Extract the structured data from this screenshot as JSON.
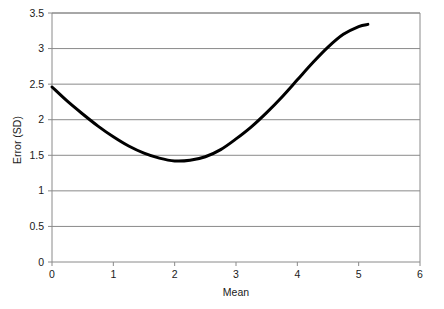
{
  "chart_data": {
    "type": "line",
    "title": "",
    "xlabel": "Mean",
    "ylabel": "Error (SD)",
    "xlim": [
      0,
      6
    ],
    "ylim": [
      0,
      3.5
    ],
    "xticks": [
      "0",
      "1",
      "2",
      "3",
      "4",
      "5",
      "6"
    ],
    "xtick_values": [
      0,
      1,
      2,
      3,
      4,
      5,
      6
    ],
    "yticks": [
      "0",
      "0.5",
      "1",
      "1.5",
      "2",
      "2.5",
      "3",
      "3.5"
    ],
    "ytick_values": [
      0,
      0.5,
      1,
      1.5,
      2,
      2.5,
      3,
      3.5
    ],
    "grid": "horizontal",
    "legend": "none",
    "series": [
      {
        "name": "Error curve",
        "color": "#000000",
        "line_width": 3,
        "x": [
          0.0,
          0.25,
          0.5,
          0.75,
          1.0,
          1.25,
          1.5,
          1.75,
          2.0,
          2.25,
          2.5,
          2.75,
          3.0,
          3.25,
          3.5,
          3.75,
          4.0,
          4.25,
          4.5,
          4.75,
          5.0,
          5.15
        ],
        "values": [
          2.46,
          2.26,
          2.08,
          1.91,
          1.76,
          1.63,
          1.53,
          1.46,
          1.42,
          1.43,
          1.48,
          1.58,
          1.73,
          1.9,
          2.1,
          2.32,
          2.56,
          2.8,
          3.02,
          3.2,
          3.31,
          3.34
        ]
      }
    ]
  },
  "axes": {
    "x_axis_label": "Mean",
    "y_axis_label": "Error (SD)"
  }
}
